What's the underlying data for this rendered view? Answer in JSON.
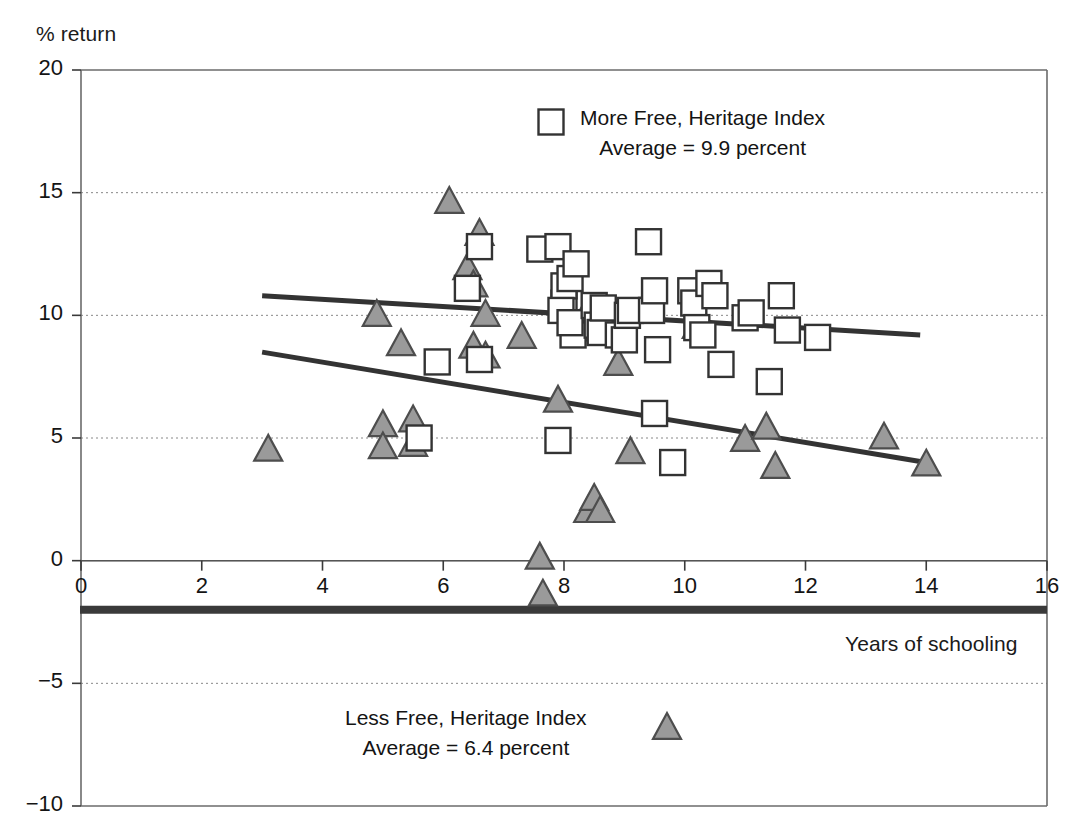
{
  "chart_data": {
    "type": "scatter",
    "title": "",
    "ylabel": "% return",
    "xlabel": "Years of schooling",
    "xlim": [
      0,
      16
    ],
    "ylim": [
      -10,
      20
    ],
    "xticks": [
      0,
      2,
      4,
      6,
      8,
      10,
      12,
      14,
      16
    ],
    "yticks": [
      20,
      15,
      10,
      5,
      0,
      -5,
      -10
    ],
    "ytick_labels": [
      "20",
      "15",
      "10",
      "5",
      "0",
      "−5",
      "−10"
    ],
    "xtick_labels": [
      "0",
      "2",
      "4",
      "6",
      "8",
      "10",
      "12",
      "14",
      "16"
    ],
    "grid": "horizontal-dotted",
    "legend_position": "inside-top-center",
    "series": [
      {
        "name": "More Free, Heritage Index",
        "marker": "square-open",
        "marker_color": "#ffffff",
        "marker_edge": "#333333",
        "average": 9.9,
        "average_label": "Average = 9.9 percent",
        "points": [
          [
            5.9,
            8.1
          ],
          [
            5.6,
            5.0
          ],
          [
            6.4,
            11.1
          ],
          [
            6.6,
            12.8
          ],
          [
            6.6,
            8.2
          ],
          [
            7.6,
            12.7
          ],
          [
            7.9,
            12.8
          ],
          [
            7.9,
            4.9
          ],
          [
            8.0,
            10.5
          ],
          [
            8.0,
            11.2
          ],
          [
            7.95,
            10.2
          ],
          [
            8.1,
            11.5
          ],
          [
            8.15,
            9.2
          ],
          [
            8.1,
            9.7
          ],
          [
            8.2,
            12.1
          ],
          [
            8.5,
            10.4
          ],
          [
            8.55,
            9.6
          ],
          [
            8.6,
            9.3
          ],
          [
            8.65,
            10.3
          ],
          [
            8.9,
            9.2
          ],
          [
            9.0,
            9.0
          ],
          [
            9.05,
            10.0
          ],
          [
            9.1,
            10.2
          ],
          [
            9.4,
            13.0
          ],
          [
            9.45,
            10.2
          ],
          [
            9.5,
            11.0
          ],
          [
            9.55,
            8.6
          ],
          [
            9.5,
            6.0
          ],
          [
            9.8,
            4.0
          ],
          [
            10.1,
            11.0
          ],
          [
            10.15,
            10.5
          ],
          [
            10.2,
            9.5
          ],
          [
            10.3,
            9.2
          ],
          [
            10.4,
            11.3
          ],
          [
            10.5,
            10.8
          ],
          [
            10.6,
            8.0
          ],
          [
            11.0,
            9.9
          ],
          [
            11.1,
            10.1
          ],
          [
            11.4,
            7.3
          ],
          [
            11.6,
            10.8
          ],
          [
            11.7,
            9.4
          ],
          [
            12.2,
            9.1
          ]
        ]
      },
      {
        "name": "Less Free, Heritage Index",
        "marker": "triangle-filled",
        "marker_color": "#9a9a9a",
        "marker_edge": "#4d4d4d",
        "average": 6.4,
        "average_label": "Average = 6.4 percent",
        "points": [
          [
            3.1,
            4.6
          ],
          [
            4.9,
            10.1
          ],
          [
            5.0,
            5.6
          ],
          [
            5.0,
            4.7
          ],
          [
            5.3,
            8.9
          ],
          [
            5.5,
            5.8
          ],
          [
            5.5,
            4.8
          ],
          [
            6.1,
            14.7
          ],
          [
            6.4,
            12.0
          ],
          [
            6.5,
            11.3
          ],
          [
            6.5,
            8.8
          ],
          [
            6.6,
            13.4
          ],
          [
            6.7,
            10.1
          ],
          [
            6.7,
            8.4
          ],
          [
            7.3,
            9.2
          ],
          [
            7.6,
            0.2
          ],
          [
            7.65,
            -1.3
          ],
          [
            7.9,
            6.6
          ],
          [
            8.4,
            10.3
          ],
          [
            8.45,
            9.5
          ],
          [
            8.4,
            2.1
          ],
          [
            8.5,
            2.6
          ],
          [
            8.6,
            2.1
          ],
          [
            8.8,
            9.4
          ],
          [
            8.9,
            8.1
          ],
          [
            9.1,
            4.5
          ],
          [
            10.2,
            9.6
          ],
          [
            11.0,
            5.0
          ],
          [
            11.35,
            5.5
          ],
          [
            11.5,
            3.9
          ],
          [
            13.3,
            5.1
          ],
          [
            14.0,
            4.0
          ]
        ]
      }
    ],
    "trend_lines": [
      {
        "name": "more-free-trend",
        "series": "More Free, Heritage Index",
        "x": [
          3.0,
          13.9
        ],
        "y": [
          10.8,
          9.2
        ],
        "color": "#333333"
      },
      {
        "name": "less-free-trend",
        "series": "Less Free, Heritage Index",
        "x": [
          3.0,
          14.0
        ],
        "y": [
          8.5,
          4.0
        ],
        "color": "#333333"
      }
    ],
    "annotations": [
      {
        "name": "baseline-bar",
        "description": "thick horizontal bar below x-axis",
        "y": -2.0,
        "x": [
          0,
          16
        ],
        "color": "#3a3a3a"
      }
    ]
  },
  "labels": {
    "ylabel": "% return",
    "xlabel": "Years of schooling"
  },
  "legend": {
    "more_free": {
      "line1": "More Free, Heritage Index",
      "line2": "Average = 9.9 percent"
    },
    "less_free": {
      "line1": "Less Free, Heritage Index",
      "line2": "Average = 6.4 percent"
    }
  }
}
